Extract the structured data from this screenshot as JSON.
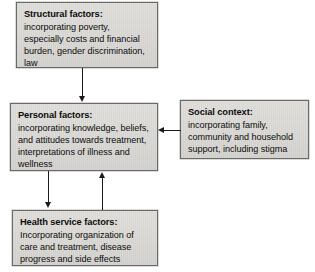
{
  "diagram": {
    "type": "flowchart",
    "background_color": "#ffffff",
    "node_fill_color": "#dedcd8",
    "node_border_color": "#6a6a68",
    "connector_color": "#1b1b1b",
    "nodes": [
      {
        "id": "structural",
        "title": "Structural factors:",
        "body": "incorporating poverty, especially costs and financial burden, gender discrimination, law"
      },
      {
        "id": "personal",
        "title": "Personal factors:",
        "body": "incorporating knowledge, beliefs, and attitudes towards treatment, interpretations of illness and wellness"
      },
      {
        "id": "social",
        "title": "Social context:",
        "body": "incorporating family, community and household support, including stigma"
      },
      {
        "id": "health",
        "title": "Health service factors:",
        "body": "Incorporating organization of care and treatment, disease progress and side effects"
      }
    ],
    "edges": [
      {
        "id": "structural-personal",
        "from": "structural",
        "to": "personal",
        "direction": "down",
        "arrow": "single"
      },
      {
        "id": "personal-health",
        "from": "personal",
        "to": "health",
        "direction": "down",
        "arrow": "single"
      },
      {
        "id": "health-personal",
        "from": "health",
        "to": "personal",
        "direction": "up",
        "arrow": "single"
      },
      {
        "id": "social-personal",
        "from": "social",
        "to": "personal",
        "direction": "left",
        "arrow": "single"
      }
    ]
  }
}
